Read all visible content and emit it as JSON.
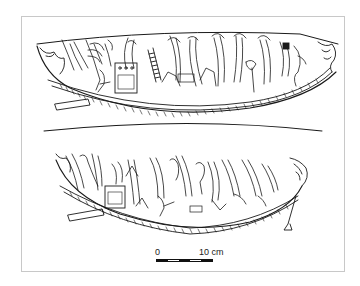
{
  "figure": {
    "panels": [
      {
        "name": "upper-boat"
      },
      {
        "name": "lower-boat"
      }
    ]
  },
  "scale_bar": {
    "start_label": "0",
    "end_label": "10 cm",
    "segments": [
      "dark",
      "light",
      "dark",
      "light",
      "dark"
    ]
  },
  "colors": {
    "ink": "#1a1a1a",
    "frame": "#c8c8c8",
    "background": "#ffffff"
  }
}
